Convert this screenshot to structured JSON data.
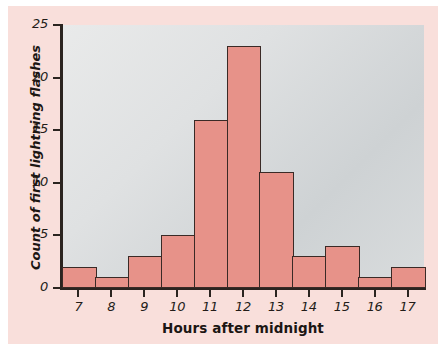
{
  "chart_data": {
    "type": "bar",
    "title": "",
    "subtitle": "",
    "xlabel": "Hours after midnight",
    "ylabel": "Count of first lightning flashes",
    "categories": [
      "7",
      "8",
      "9",
      "10",
      "11",
      "12",
      "13",
      "14",
      "15",
      "16",
      "17"
    ],
    "values": [
      2,
      1,
      3,
      5,
      16,
      23,
      11,
      3,
      4,
      1,
      2
    ],
    "ylim": [
      0,
      25
    ],
    "yticks": [
      0,
      5,
      10,
      15,
      20,
      25
    ],
    "ytick_labels": [
      "0",
      "5",
      "10",
      "15",
      "20",
      "25"
    ],
    "xticks": [
      7,
      8,
      9,
      10,
      11,
      12,
      13,
      14,
      15,
      16,
      17
    ],
    "xtick_labels": [
      "7",
      "8",
      "9",
      "10",
      "11",
      "12",
      "13",
      "14",
      "15",
      "16",
      "17"
    ],
    "grid": false,
    "legend": null,
    "bin_width": 1,
    "bar_fill_color": "#e79289",
    "bar_edge_color": "#3a2a26",
    "plot_background": "#d9dcdd",
    "page_background": "#f9dfdb"
  }
}
